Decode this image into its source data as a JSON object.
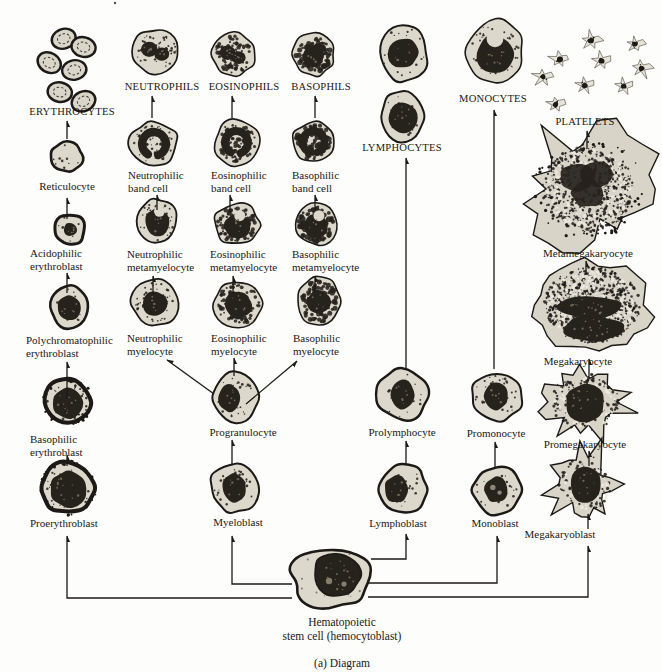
{
  "caption": "(a) Diagram",
  "colors": {
    "ink": "#1c1916",
    "cytoplasm": "#dcd8cc",
    "nucleus": "#26221c",
    "background": "#fdfdfb"
  },
  "stem_cell": {
    "label_line1": "Hematopoietic",
    "label_line2": "stem cell (hemocytoblast)"
  },
  "lineages": {
    "erythroid": {
      "mature": "ERYTHROCYTES",
      "reticulocyte": "Reticulocyte",
      "acidophilic_erythroblast": "Acidophilic erythroblast",
      "polychromatophilic_erythroblast": "Polychromatophilic erythroblast",
      "basophilic_erythroblast": "Basophilic erythroblast",
      "proerythroblast": "Proerythroblast"
    },
    "neutrophil": {
      "mature": "NEUTROPHILS",
      "band_cell": "Neutrophilic band cell",
      "metamyelocyte": "Neutrophilic metamyelocyte",
      "myelocyte": "Neutrophilic myelocyte"
    },
    "eosinophil": {
      "mature": "EOSINOPHILS",
      "band_cell": "Eosinophilic band cell",
      "metamyelocyte": "Eosinophilic metamyelocyte",
      "myelocyte": "Eosinophilic myelocyte"
    },
    "basophil": {
      "mature": "BASOPHILS",
      "band_cell": "Basophilic band cell",
      "metamyelocyte": "Basophilic metamyelocyte",
      "myelocyte": "Basophilic myelocyte"
    },
    "granulocyte_common": {
      "progranulocyte": "Progranulocyte",
      "myeloblast": "Myeloblast"
    },
    "lymphoid": {
      "mature": "LYMPHOCYTES",
      "prolymphocyte": "Prolymphocyte",
      "lymphoblast": "Lymphoblast"
    },
    "monocytic": {
      "mature": "MONOCYTES",
      "promonocyte": "Promonocyte",
      "monoblast": "Monoblast"
    },
    "megakaryocytic": {
      "mature": "PLATELETS",
      "metamegakaryocyte": "Metamegakaryocyte",
      "megakaryocyte": "Megakaryocyte",
      "promegakaryocyte": "Promegakaryocyte",
      "megakaryoblast": "Megakaryoblast"
    }
  }
}
